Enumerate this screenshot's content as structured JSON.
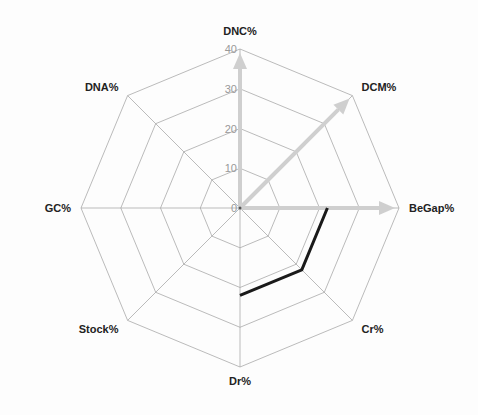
{
  "chart_data": {
    "type": "radar",
    "title": "",
    "axes": [
      "DNC%",
      "DCM%",
      "BeGap%",
      "Cr%",
      "Dr%",
      "Stock%",
      "GC%",
      "DNA%"
    ],
    "range": [
      0,
      40
    ],
    "ticks": [
      0,
      10,
      20,
      30,
      40
    ],
    "grid": true,
    "legend": null,
    "arrows": [
      {
        "axis": "DNC%",
        "value": 39,
        "color": "#cfcfcf"
      },
      {
        "axis": "DCM%",
        "value": 39,
        "color": "#cfcfcf"
      },
      {
        "axis": "BeGap%",
        "value": 39,
        "color": "#cfcfcf"
      }
    ],
    "series": [
      {
        "name": "profile",
        "color": "#1a1a1a",
        "points": [
          {
            "axis": "BeGap%",
            "value": 22
          },
          {
            "axis": "Cr%",
            "value": 22
          },
          {
            "axis": "Dr%",
            "value": 22
          }
        ]
      }
    ]
  },
  "layout": {
    "center": [
      240,
      208
    ],
    "radius": 159
  }
}
